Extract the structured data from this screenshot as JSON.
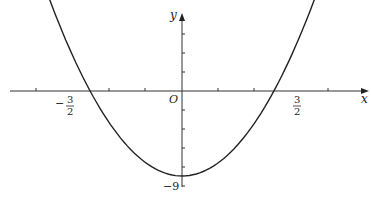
{
  "chart_data": {
    "type": "line",
    "title": "",
    "function": "y = 4x^2 - 9",
    "xlabel": "x",
    "ylabel": "y",
    "origin_label": "O",
    "x_intercepts": [
      -1.5,
      1.5
    ],
    "x_intercept_labels": [
      {
        "sign": "−",
        "num": "3",
        "den": "2"
      },
      {
        "sign": "",
        "num": "3",
        "den": "2"
      }
    ],
    "y_intercept": -9,
    "y_intercept_label": "−9",
    "vertex": [
      0,
      -9
    ],
    "series": [
      {
        "name": "parabola",
        "x": [
          -1.88,
          -1.5,
          -1.0,
          -0.5,
          0,
          0.5,
          1.0,
          1.5,
          1.89
        ],
        "y": [
          5.1,
          0,
          -5,
          -8,
          -9,
          -8,
          -5,
          0,
          5.3
        ]
      }
    ],
    "x_tick_step": 0.5,
    "grid": false,
    "legend": false,
    "color": "#222222"
  }
}
